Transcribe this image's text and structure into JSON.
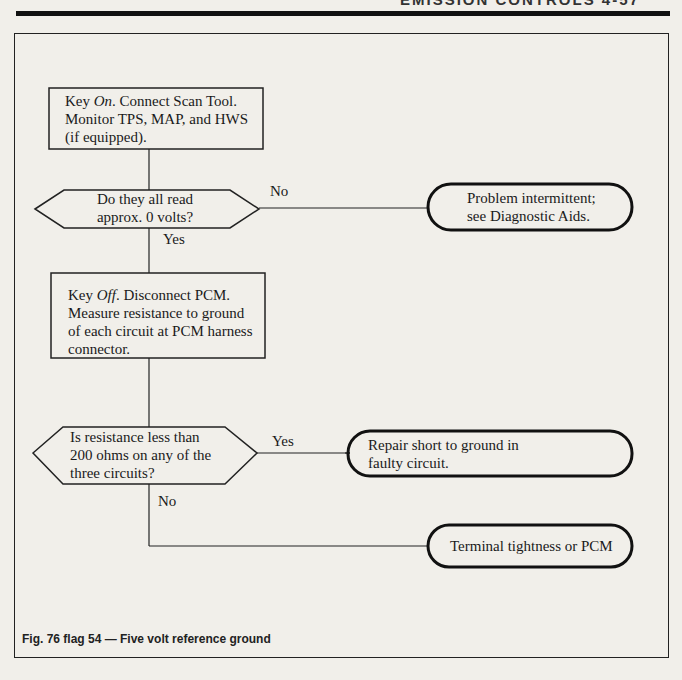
{
  "page": {
    "running_head": "EMISSION CONTROLS   4-57"
  },
  "flowchart": {
    "step1": {
      "line1_prefix": "Key ",
      "line1_em": "On",
      "line1_rest": ". Connect Scan Tool.",
      "line2": "Monitor TPS, MAP, and HWS",
      "line3": "(if equipped)."
    },
    "decision1": {
      "line1": "Do they all read",
      "line2": "approx. 0 volts?",
      "no_label": "No",
      "yes_label": "Yes"
    },
    "terminal1": {
      "line1": "Problem intermittent;",
      "line2": "see Diagnostic Aids."
    },
    "step2": {
      "line1_prefix": "Key ",
      "line1_em": "Off",
      "line1_rest": ". Disconnect PCM.",
      "line2": "Measure resistance to ground",
      "line3": "of each circuit at PCM harness",
      "line4": "connector."
    },
    "decision2": {
      "line1": "Is resistance less than",
      "line2": "200 ohms on any of the",
      "line3": "three circuits?",
      "yes_label": "Yes",
      "no_label": "No"
    },
    "terminal2": {
      "line1": "Repair short to ground in",
      "line2": "faulty circuit."
    },
    "terminal3": {
      "line1": "Terminal tightness or PCM"
    }
  },
  "caption": "Fig. 76 flag 54 — Five volt reference ground"
}
